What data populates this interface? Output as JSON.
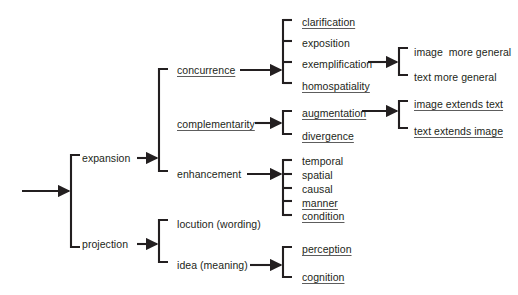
{
  "diagram": {
    "line_color": "#231f20",
    "text_color": "#231f20",
    "background": "#ffffff",
    "root": {
      "inbound_arrow": "arrow-right"
    },
    "level1": [
      {
        "id": "expansion",
        "label": "expansion",
        "underlined": false,
        "x": 82,
        "y": 158
      },
      {
        "id": "projection",
        "label": "projection",
        "underlined": false,
        "x": 82,
        "y": 244
      }
    ],
    "level2": [
      {
        "id": "concurrence",
        "label": "concurrence",
        "underlined": true,
        "x": 177,
        "y": 70
      },
      {
        "id": "complementarity",
        "label": "complementarity",
        "underlined": true,
        "x": 177,
        "y": 124
      },
      {
        "id": "enhancement",
        "label": "enhancement",
        "underlined": false,
        "x": 177,
        "y": 174
      },
      {
        "id": "locution-wording",
        "label": "locution (wording)",
        "underlined": false,
        "x": 177,
        "y": 224
      },
      {
        "id": "idea-meaning",
        "label": "idea (meaning)",
        "underlined": false,
        "x": 177,
        "y": 265
      }
    ],
    "level3": {
      "concurrence_children": [
        {
          "id": "clarification",
          "label": "clarification",
          "underlined": true,
          "x": 302,
          "y": 22
        },
        {
          "id": "exposition",
          "label": "exposition",
          "underlined": false,
          "x": 302,
          "y": 43
        },
        {
          "id": "exemplification",
          "label": "exemplification",
          "underlined": false,
          "x": 302,
          "y": 64
        },
        {
          "id": "homospatiality",
          "label": "homospatiality",
          "underlined": true,
          "x": 302,
          "y": 86
        }
      ],
      "complementarity_children": [
        {
          "id": "augmentation",
          "label": "augmentation",
          "underlined": true,
          "x": 302,
          "y": 113
        },
        {
          "id": "divergence",
          "label": "divergence",
          "underlined": true,
          "x": 302,
          "y": 136
        }
      ],
      "enhancement_children": [
        {
          "id": "temporal",
          "label": "temporal",
          "underlined": false,
          "x": 302,
          "y": 162
        },
        {
          "id": "spatial",
          "label": "spatial",
          "underlined": false,
          "x": 302,
          "y": 176
        },
        {
          "id": "causal",
          "label": "causal",
          "underlined": false,
          "x": 302,
          "y": 190
        },
        {
          "id": "manner",
          "label": "manner",
          "underlined": true,
          "x": 302,
          "y": 204
        },
        {
          "id": "condition",
          "label": "condition",
          "underlined": true,
          "x": 302,
          "y": 217
        }
      ],
      "idea_children": [
        {
          "id": "perception",
          "label": "perception",
          "underlined": true,
          "x": 302,
          "y": 250
        },
        {
          "id": "cognition",
          "label": "cognition",
          "underlined": true,
          "x": 302,
          "y": 278
        }
      ]
    },
    "level4": {
      "exemplification_children": [
        {
          "id": "image-more-general",
          "label": "image  more general",
          "underlined": false,
          "x": 414,
          "y": 52
        },
        {
          "id": "text-more-general",
          "label": "text more general",
          "underlined": false,
          "x": 414,
          "y": 77
        }
      ],
      "augmentation_children": [
        {
          "id": "image-extends-text",
          "label": "image extends text",
          "underlined": true,
          "x": 414,
          "y": 104
        },
        {
          "id": "text-extends-image",
          "label": "text extends image",
          "underlined": true,
          "x": 414,
          "y": 131
        }
      ]
    }
  }
}
